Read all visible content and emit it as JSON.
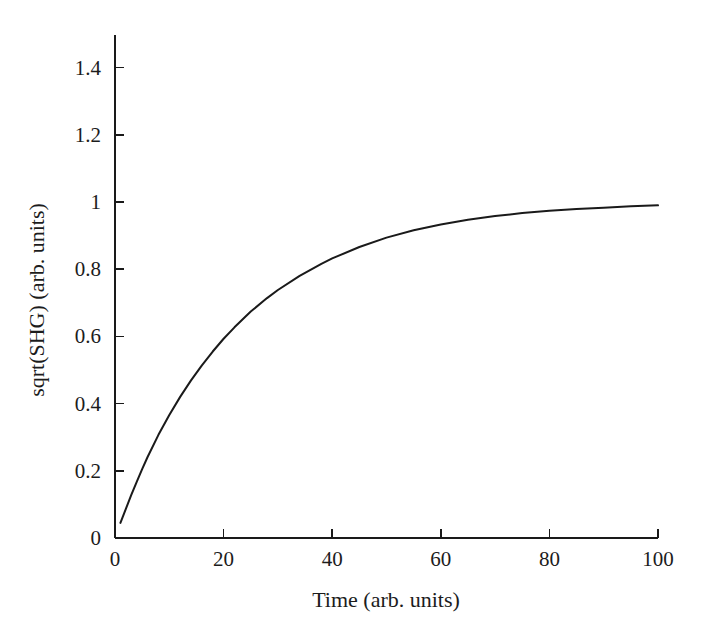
{
  "chart_data": {
    "type": "line",
    "title": "",
    "subtitle": "",
    "xlabel": "Time (arb. units)",
    "ylabel": "sqrt(SHG) (arb. units)",
    "xlim": [
      0,
      100
    ],
    "ylim": [
      0,
      1.5
    ],
    "x_ticks": [
      0,
      20,
      40,
      60,
      80,
      100
    ],
    "x_tick_labels": [
      "0",
      "20",
      "40",
      "60",
      "80",
      "100"
    ],
    "y_ticks": [
      0,
      0.2,
      0.4,
      0.6,
      0.8,
      1,
      1.2,
      1.4
    ],
    "y_tick_labels": [
      "0",
      "0.2",
      "0.4",
      "0.6",
      "0.8",
      "1",
      "1.2",
      "1.4"
    ],
    "grid": false,
    "legend": null,
    "annotations": [],
    "line_color": "#1a1a1a",
    "line_width": 2.0,
    "series": [
      {
        "name": "sqrt(SHG)",
        "x": [
          1,
          2,
          3,
          4,
          5,
          6,
          8,
          10,
          12,
          14,
          16,
          18,
          20,
          22,
          25,
          28,
          30,
          34,
          38,
          40,
          45,
          50,
          55,
          60,
          65,
          70,
          75,
          80,
          85,
          90,
          95,
          100
        ],
        "values": [
          0.045,
          0.087,
          0.128,
          0.167,
          0.205,
          0.241,
          0.307,
          0.366,
          0.42,
          0.469,
          0.514,
          0.555,
          0.593,
          0.627,
          0.674,
          0.714,
          0.738,
          0.78,
          0.816,
          0.832,
          0.866,
          0.894,
          0.916,
          0.933,
          0.947,
          0.958,
          0.967,
          0.974,
          0.979,
          0.983,
          0.987,
          0.99
        ]
      }
    ]
  },
  "axes": {
    "x_axis_name": "time-axis",
    "y_axis_name": "sqrt-shg-axis"
  }
}
